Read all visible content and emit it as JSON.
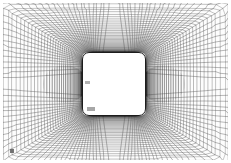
{
  "figure": {
    "type": "structured-curvilinear-mesh",
    "background_color": "#ffffff",
    "plot_background_color": "#fdfdfd",
    "line_color": "#4a4a4a",
    "body_outline_color": "#1c1c1c",
    "body_fill_color": "#ffffff",
    "margin_px": 3,
    "width_px": 231,
    "height_px": 163
  },
  "mesh": {
    "domain": {
      "x_min": 0,
      "x_max": 225,
      "y_min": 0,
      "y_max": 157
    },
    "body": {
      "shape": "square",
      "x": 79,
      "y": 49,
      "width": 64,
      "height": 64,
      "corner_radius": 7,
      "center_x": 111,
      "center_y": 81
    },
    "far_field": {
      "cell_size_px": 6.6,
      "columns": 34,
      "rows": 24,
      "line_width": 0.55,
      "line_color": "#8c8c8c"
    },
    "near_field": {
      "radial_layers": 46,
      "circumferential_divisions": 132,
      "first_layer_thickness_px": 0.45,
      "growth_ratio": 1.13,
      "line_width": 0.4,
      "line_color": "#3a3a3a"
    },
    "blend": {
      "transition_radius_px": 78,
      "description": "curvilinear O-grid wrapped on the square blending into the rectilinear background grid"
    },
    "refinement_zones": [
      {
        "name": "left-stagnation-cluster",
        "center_x": 62,
        "center_y": 81,
        "radius": 22,
        "density": "high"
      },
      {
        "name": "right-wake-cluster",
        "center_x": 160,
        "center_y": 81,
        "radius": 22,
        "density": "high"
      }
    ]
  },
  "annotations": {
    "body_mark_left": "",
    "body_mark_lower": "",
    "corner_tick": ""
  }
}
